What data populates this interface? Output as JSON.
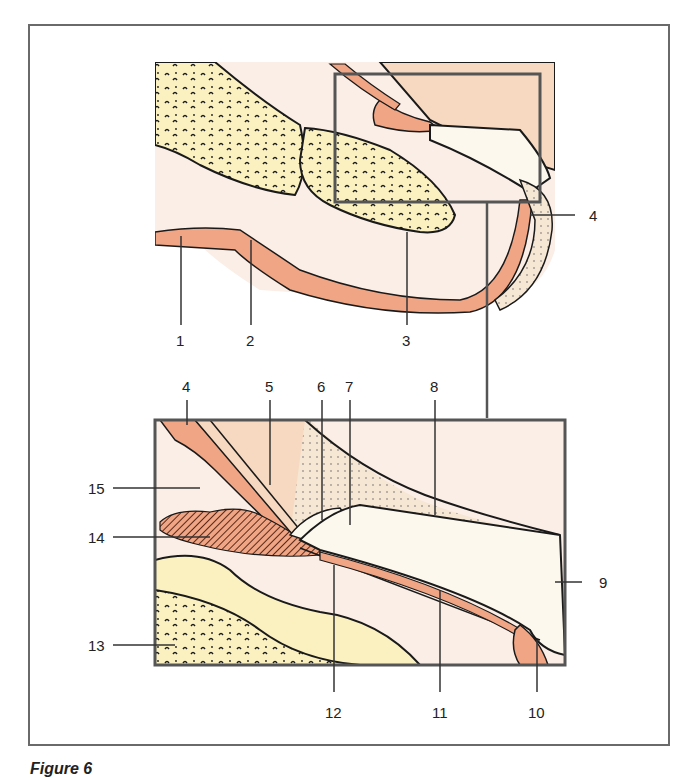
{
  "figure": {
    "caption": "Figure 6",
    "colors": {
      "bone": "#FBF1C0",
      "soft_tissue": "#FBEEE6",
      "dermis": "#F0A585",
      "skin": "#F6D9C0",
      "nail": "#FDF8EE",
      "frame": "#6a6a6a",
      "line": "#1a1a1a"
    }
  },
  "overview": {
    "labels": [
      {
        "id": "1",
        "text": "1"
      },
      {
        "id": "2",
        "text": "2"
      },
      {
        "id": "3",
        "text": "3"
      },
      {
        "id": "4",
        "text": "4"
      }
    ]
  },
  "detail": {
    "labels": [
      {
        "id": "4",
        "text": "4"
      },
      {
        "id": "5",
        "text": "5"
      },
      {
        "id": "6",
        "text": "6"
      },
      {
        "id": "7",
        "text": "7"
      },
      {
        "id": "8",
        "text": "8"
      },
      {
        "id": "9",
        "text": "9"
      },
      {
        "id": "10",
        "text": "10"
      },
      {
        "id": "11",
        "text": "11"
      },
      {
        "id": "12",
        "text": "12"
      },
      {
        "id": "13",
        "text": "13"
      },
      {
        "id": "14",
        "text": "14"
      },
      {
        "id": "15",
        "text": "15"
      }
    ]
  }
}
